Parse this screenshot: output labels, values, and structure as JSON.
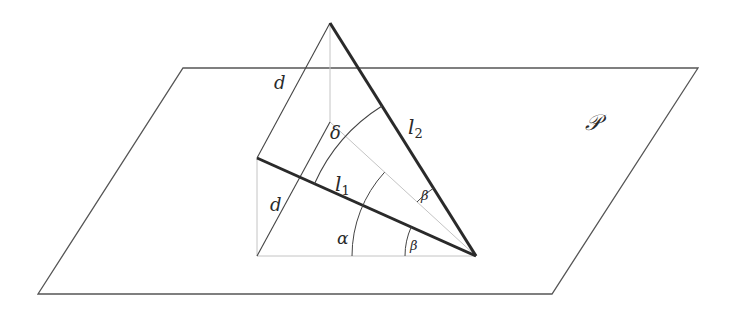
{
  "figure": {
    "plane_label": "𝒫",
    "labels": {
      "d_upper": "d",
      "d_lower": "d",
      "delta": "δ",
      "l1_main": "l",
      "l1_sub": "1",
      "l2_main": "l",
      "l2_sub": "2",
      "alpha": "α",
      "beta_upper": "β",
      "beta_lower": "β"
    },
    "colors": {
      "plane_edge": "#555555",
      "thick_line": "#2a2a2a",
      "thin_line": "#444444",
      "grey_line": "#bbbbbb"
    }
  }
}
